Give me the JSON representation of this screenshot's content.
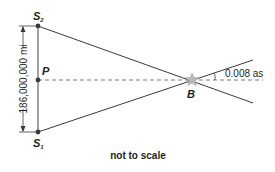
{
  "diagram": {
    "type": "parallax-geometry",
    "points": {
      "s2": {
        "label": "S",
        "subscript": "2"
      },
      "s1": {
        "label": "S",
        "subscript": "1"
      },
      "p": {
        "label": "P"
      },
      "b": {
        "label": "B"
      }
    },
    "distance_label": "186,000,000 mi",
    "angle_label": "0.008 as",
    "footnote": "not to scale",
    "colors": {
      "line": "#3a3a3a",
      "vertical": "#8a8a8a",
      "dashed": "#7a7a7a",
      "star": "#b0b0b0",
      "text": "#231f20"
    }
  }
}
